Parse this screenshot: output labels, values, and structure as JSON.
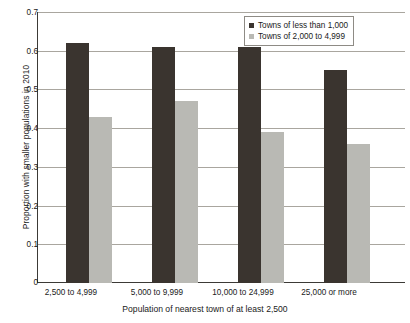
{
  "chart_data": {
    "type": "bar",
    "title": "",
    "subtitle": "",
    "xlabel": "Population of nearest town of at least 2,500",
    "ylabel": "Proportion with smaller populations in 2010",
    "categories": [
      "2,500 to 4,999",
      "5,000 to 9,999",
      "10,000 to 24,999",
      "25,000 or more"
    ],
    "series": [
      {
        "name": "Towns of less than 1,000",
        "color": "#3a342f",
        "values": [
          0.62,
          0.61,
          0.61,
          0.55
        ]
      },
      {
        "name": "Towns of 2,000 to 4,999",
        "color": "#b9b9b4",
        "values": [
          0.43,
          0.47,
          0.39,
          0.36
        ]
      }
    ],
    "ylim": [
      0,
      0.7
    ],
    "ytick_labels": [
      "0.7",
      "0.6",
      "0.5",
      "0.4",
      "0.3",
      "0.2",
      "0.1",
      "0"
    ],
    "ytick_values": [
      0.7,
      0.6,
      0.5,
      0.4,
      0.3,
      0.2,
      0.1,
      0
    ],
    "grid": "horizontal",
    "legend_position": "top-right",
    "annotations": []
  },
  "legend": {
    "items": [
      {
        "label": "Towns of less than 1,000",
        "swatch": "dark-square-swatch"
      },
      {
        "label": "Towns of 2,000 to 4,999",
        "swatch": "light-square-swatch"
      }
    ]
  }
}
